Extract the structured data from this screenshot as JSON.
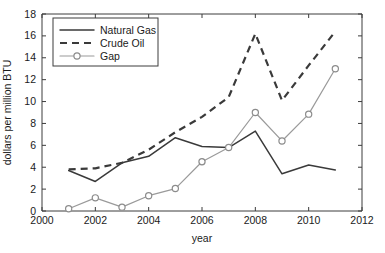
{
  "chart_data": {
    "type": "line",
    "title": "",
    "xlabel": "year",
    "ylabel": "dollars per million BTU",
    "xlim": [
      2000,
      2012
    ],
    "ylim": [
      0,
      18
    ],
    "xticks": [
      2000,
      2002,
      2004,
      2006,
      2008,
      2010,
      2012
    ],
    "yticks": [
      0,
      2,
      4,
      6,
      8,
      10,
      12,
      14,
      16,
      18
    ],
    "xtick_labels": [
      "2000",
      "2002",
      "2004",
      "2006",
      "2008",
      "2010",
      "2012"
    ],
    "ytick_labels": [
      "0",
      "2",
      "4",
      "6",
      "8",
      "10",
      "12",
      "14",
      "16",
      "18"
    ],
    "grid": false,
    "legend_position": "upper left",
    "series": [
      {
        "name": "Natural Gas",
        "style": "solid",
        "color": "#3a3a3a",
        "marker": "none",
        "x": [
          2001,
          2002,
          2003,
          2004,
          2005,
          2006,
          2007,
          2008,
          2009,
          2010,
          2011
        ],
        "values": [
          3.7,
          2.7,
          4.4,
          5.0,
          6.7,
          5.9,
          5.8,
          7.3,
          3.4,
          4.2,
          3.75
        ]
      },
      {
        "name": "Crude Oil",
        "style": "dashed",
        "color": "#3a3a3a",
        "marker": "none",
        "x": [
          2001,
          2002,
          2003,
          2004,
          2005,
          2006,
          2007,
          2008,
          2009,
          2010,
          2011
        ],
        "values": [
          3.8,
          3.9,
          4.4,
          5.6,
          7.2,
          8.6,
          10.4,
          16.2,
          10.1,
          13.3,
          16.4
        ]
      },
      {
        "name": "Gap",
        "style": "solid",
        "color": "#9a9a9a",
        "marker": "circle",
        "x": [
          2001,
          2002,
          2003,
          2004,
          2005,
          2006,
          2007,
          2008,
          2009,
          2010,
          2011
        ],
        "values": [
          0.2,
          1.2,
          0.35,
          1.4,
          2.05,
          4.5,
          5.8,
          9.0,
          6.4,
          8.85,
          13.0
        ]
      }
    ]
  },
  "legend": {
    "entries": [
      {
        "label": "Natural Gas"
      },
      {
        "label": "Crude Oil"
      },
      {
        "label": "Gap"
      }
    ]
  }
}
